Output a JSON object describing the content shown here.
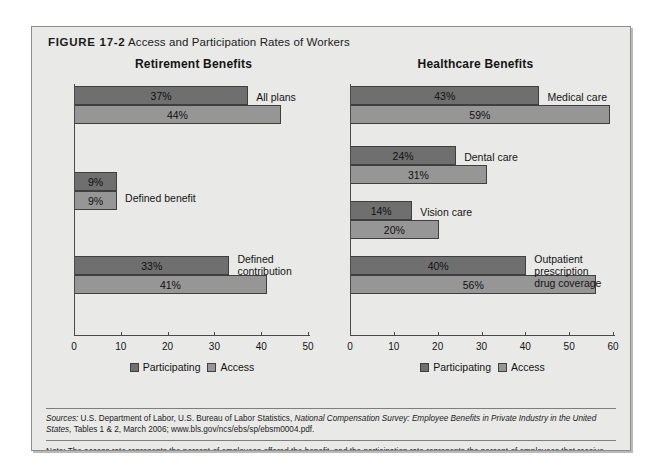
{
  "figure": {
    "number": "FIGURE 17-2",
    "caption": "Access and Participation Rates of Workers"
  },
  "legend": {
    "participating_label": "Participating",
    "access_label": "Access",
    "participating_color": "#6f6f6f",
    "access_color": "#969696"
  },
  "footer": {
    "sources_prefix": "Sources:",
    "sources_text_1": " U.S. Department of Labor, U.S. Bureau of Labor Statistics, ",
    "sources_italic": "National Compensation Survey: Employee Benefits in Private Industry in the United States,",
    "sources_text_2": " Tables 1 & 2, March 2006; www.bls.gov/ncs/ebs/sp/ebsm0004.pdf.",
    "note": "Note: The access rate represents the percent of employees offered the benefit, and the participation rate represents the percent of employees that receive the benefit."
  },
  "chart_data": [
    {
      "type": "bar",
      "title": "Retirement Benefits",
      "orientation": "horizontal",
      "categories": [
        "All plans",
        "Defined benefit",
        "Defined contribution"
      ],
      "series": [
        {
          "name": "Participating",
          "values": [
            37,
            9,
            33
          ],
          "color": "#6f6f6f"
        },
        {
          "name": "Access",
          "values": [
            44,
            9,
            41
          ],
          "color": "#969696"
        }
      ],
      "value_labels": {
        "Participating": [
          "37%",
          "9%",
          "33%"
        ],
        "Access": [
          "44%",
          "9%",
          "41%"
        ]
      },
      "xlabel": "",
      "ylabel": "",
      "xlim": [
        0,
        50
      ],
      "xticks": [
        0,
        10,
        20,
        30,
        40,
        50
      ],
      "xtick_labels": [
        "0",
        "10",
        "20",
        "30",
        "40",
        "50"
      ],
      "grid": false,
      "legend_position": "bottom"
    },
    {
      "type": "bar",
      "title": "Healthcare Benefits",
      "orientation": "horizontal",
      "categories": [
        "Medical care",
        "Dental care",
        "Vision care",
        "Outpatient prescription\ndrug coverage"
      ],
      "series": [
        {
          "name": "Participating",
          "values": [
            43,
            24,
            14,
            40
          ],
          "color": "#6f6f6f"
        },
        {
          "name": "Access",
          "values": [
            59,
            31,
            20,
            56
          ],
          "color": "#969696"
        }
      ],
      "value_labels": {
        "Participating": [
          "43%",
          "24%",
          "14%",
          "40%"
        ],
        "Access": [
          "59%",
          "31%",
          "20%",
          "56%"
        ]
      },
      "xlabel": "",
      "ylabel": "",
      "xlim": [
        0,
        60
      ],
      "xticks": [
        0,
        10,
        20,
        30,
        40,
        50,
        60
      ],
      "xtick_labels": [
        "0",
        "10",
        "20",
        "30",
        "40",
        "50",
        "60"
      ],
      "grid": false,
      "legend_position": "bottom"
    }
  ]
}
